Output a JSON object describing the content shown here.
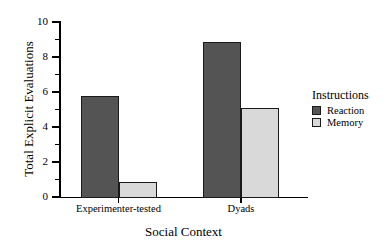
{
  "chart_data": {
    "type": "bar",
    "title": "",
    "subtitle": "",
    "xlabel": "Social Context",
    "ylabel": "Total Explicit Evaluations",
    "categories": [
      "Experimenter-tested",
      "Dyads"
    ],
    "series": [
      {
        "name": "Reaction",
        "values": [
          5.8,
          8.85
        ],
        "color": "#545454"
      },
      {
        "name": "Memory",
        "values": [
          0.85,
          5.1
        ],
        "color": "#d9d9d9"
      }
    ],
    "ylim": [
      0,
      10
    ],
    "ytick_labels": [
      "0",
      "2",
      "4",
      "6",
      "8",
      "10"
    ],
    "ytick_values": [
      0,
      2,
      4,
      6,
      8,
      10
    ],
    "yminor_values": [
      1,
      3,
      5,
      7,
      9
    ],
    "grid": false,
    "legend": {
      "title": "Instructions",
      "position": "right",
      "entries": [
        {
          "label": "Reaction",
          "color": "#545454"
        },
        {
          "label": "Memory",
          "color": "#d9d9d9"
        }
      ]
    },
    "axis_color": "#000000",
    "background": "#ffffff"
  },
  "ticks": {
    "y": [
      {
        "label": "10",
        "value": 10
      },
      {
        "label": "8",
        "value": 8
      },
      {
        "label": "6",
        "value": 6
      },
      {
        "label": "4",
        "value": 4
      },
      {
        "label": "2",
        "value": 2
      },
      {
        "label": "0",
        "value": 0
      }
    ]
  },
  "bars": [
    {
      "name": "bar-experimenter-tested-reaction",
      "value": 5.8
    },
    {
      "name": "bar-experimenter-tested-memory",
      "value": 0.85
    },
    {
      "name": "bar-dyads-reaction",
      "value": 8.85
    },
    {
      "name": "bar-dyads-memory",
      "value": 5.1
    }
  ]
}
